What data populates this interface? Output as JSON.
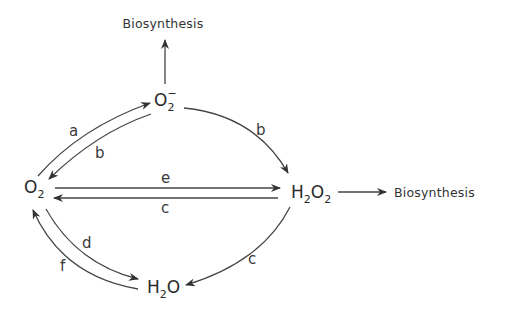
{
  "diagram": {
    "type": "reaction-cycle",
    "nodes": {
      "superoxide": {
        "base": "O",
        "sub": "2",
        "sup": "−"
      },
      "oxygen": {
        "base": "O",
        "sub": "2"
      },
      "peroxide": {
        "p1": "H",
        "s1": "2",
        "p2": "O",
        "s2": "2"
      },
      "water": {
        "p1": "H",
        "s1": "2",
        "p2": "O"
      }
    },
    "outputs": {
      "top": "Biosynthesis",
      "right": "Biosynthesis"
    },
    "edges": [
      {
        "from": "O2",
        "to": "O2-",
        "label": "a"
      },
      {
        "from": "O2-",
        "to": "O2",
        "label": "b"
      },
      {
        "from": "O2-",
        "to": "H2O2",
        "label": "b"
      },
      {
        "from": "O2",
        "to": "H2O2",
        "label": "e"
      },
      {
        "from": "H2O2",
        "to": "O2",
        "label": "c"
      },
      {
        "from": "H2O2",
        "to": "H2O",
        "label": "c"
      },
      {
        "from": "O2",
        "to": "H2O",
        "label": "d"
      },
      {
        "from": "H2O",
        "to": "O2",
        "label": "f"
      },
      {
        "from": "O2-",
        "to": "Biosynthesis",
        "label": ""
      },
      {
        "from": "H2O2",
        "to": "Biosynthesis",
        "label": ""
      }
    ],
    "labels": {
      "a": "a",
      "b_upper": "b",
      "b_right": "b",
      "e": "e",
      "c_mid": "c",
      "c_lower": "c",
      "d": "d",
      "f": "f"
    }
  }
}
